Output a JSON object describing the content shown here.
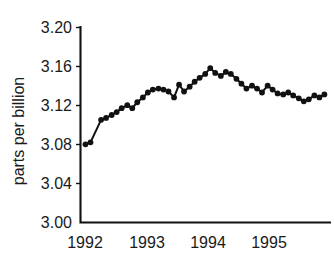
{
  "chart_data": {
    "type": "line",
    "title": "",
    "subtitle": "",
    "xlabel": "",
    "ylabel": "parts per billion",
    "xlim": [
      1991.92,
      1995.92
    ],
    "ylim": [
      3.0,
      3.2
    ],
    "grid": false,
    "legend": null,
    "marker": "filled-circle",
    "line_style": "solid",
    "series_color": "#111111",
    "x_tick_labels": [
      "1992",
      "1993",
      "1994",
      "1995"
    ],
    "x_tick_values": [
      1992,
      1993,
      1994,
      1995
    ],
    "y_tick_labels": [
      "3.00",
      "3.04",
      "3.08",
      "3.12",
      "3.16",
      "3.20"
    ],
    "y_tick_values": [
      3.0,
      3.04,
      3.08,
      3.12,
      3.16,
      3.2
    ],
    "series": [
      {
        "name": "concentration",
        "x": [
          1992.0,
          1992.08,
          1992.25,
          1992.33,
          1992.42,
          1992.5,
          1992.58,
          1992.67,
          1992.75,
          1992.83,
          1992.92,
          1993.0,
          1993.08,
          1993.17,
          1993.25,
          1993.33,
          1993.42,
          1993.5,
          1993.58,
          1993.67,
          1993.75,
          1993.83,
          1993.92,
          1994.0,
          1994.08,
          1994.17,
          1994.25,
          1994.33,
          1994.42,
          1994.5,
          1994.58,
          1994.67,
          1994.75,
          1994.83,
          1994.92,
          1995.0,
          1995.08,
          1995.17,
          1995.25,
          1995.33,
          1995.42,
          1995.5,
          1995.58,
          1995.67,
          1995.75,
          1995.83
        ],
        "values": [
          3.08,
          3.082,
          3.105,
          3.107,
          3.11,
          3.113,
          3.117,
          3.12,
          3.117,
          3.123,
          3.128,
          3.133,
          3.136,
          3.137,
          3.136,
          3.134,
          3.128,
          3.141,
          3.134,
          3.139,
          3.144,
          3.148,
          3.152,
          3.158,
          3.153,
          3.15,
          3.154,
          3.152,
          3.147,
          3.142,
          3.137,
          3.14,
          3.137,
          3.133,
          3.14,
          3.136,
          3.132,
          3.131,
          3.133,
          3.13,
          3.127,
          3.124,
          3.126,
          3.13,
          3.128,
          3.131
        ]
      }
    ]
  }
}
